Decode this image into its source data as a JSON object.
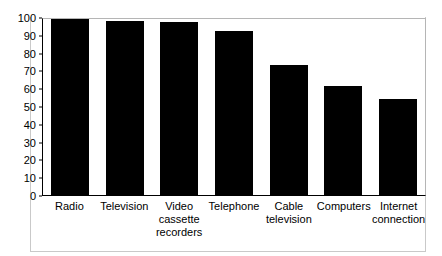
{
  "chart_data": {
    "type": "bar",
    "title": "",
    "subtitle": "",
    "xlabel": "",
    "ylabel": "",
    "ylim": [
      0,
      100
    ],
    "yticks": [
      0,
      10,
      20,
      30,
      40,
      50,
      60,
      70,
      80,
      90,
      100
    ],
    "grid": false,
    "legend": false,
    "legend_position": "none",
    "bar_color": "#000000",
    "axis_color": "#000000",
    "frame_color": "#b5b5b5",
    "background": "#ffffff",
    "categories": [
      "Radio",
      "Television",
      "Video cassette recorders",
      "Telephone",
      "Cable television",
      "Computers",
      "Internet connection"
    ],
    "category_lines": [
      [
        "Radio"
      ],
      [
        "Television"
      ],
      [
        "Video",
        "cassette",
        "recorders"
      ],
      [
        "Telephone"
      ],
      [
        "Cable",
        "television"
      ],
      [
        "Computers"
      ],
      [
        "Internet",
        "connection"
      ]
    ],
    "values": [
      99,
      98,
      97,
      92,
      73,
      61,
      54
    ]
  }
}
